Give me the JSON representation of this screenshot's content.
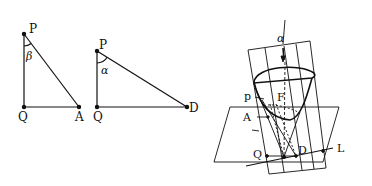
{
  "figure": {
    "triangle_1": {
      "vertices": {
        "top": "P",
        "bottom_left": "Q",
        "bottom_right": "A"
      },
      "angle_label": "β"
    },
    "triangle_2": {
      "vertices": {
        "top": "P",
        "bottom_left": "Q",
        "bottom_right": "D"
      },
      "angle_label": "α"
    },
    "solid_figure": {
      "angle_label": "α",
      "labels": {
        "p": "p",
        "F": "F",
        "A": "A",
        "Q": "Q",
        "D": "D",
        "L": "L"
      }
    }
  },
  "colors": {
    "stroke": "#111111",
    "background": "#ffffff"
  }
}
